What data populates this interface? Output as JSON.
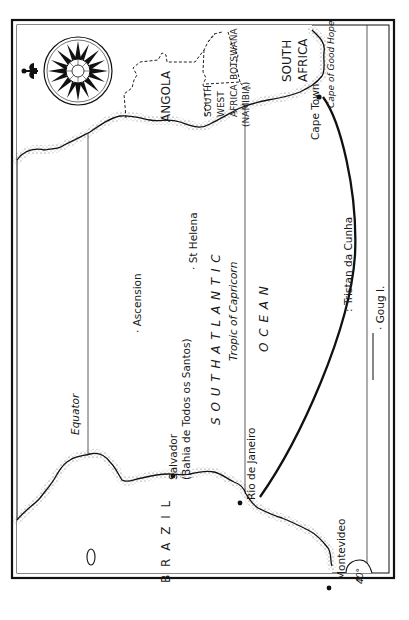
{
  "map": {
    "orientation": "rotated 90 degrees counter-clockwise (north to the left)",
    "reference_lines": [
      {
        "label": "Equator"
      },
      {
        "label": "Tropic of Capricorn"
      },
      {
        "label": "40°"
      }
    ],
    "countries": {
      "angola": "ANGOLA",
      "botswana": "BOTSWANA",
      "south_west_africa_1": "SOUTH",
      "south_west_africa_2": "WEST",
      "south_west_africa_3": "AFRICA",
      "namibia": "(NAMIBIA)",
      "south_africa_1": "SOUTH",
      "south_africa_2": "AFRICA",
      "brazil": "B R A Z I L"
    },
    "ocean": {
      "line1": "S O U T H   A T L A N T I C",
      "line2": "O C E A N"
    },
    "places": {
      "cape_town": "Cape Town",
      "cape_of_good_hope": "Cape of Good Hope",
      "tristan": ": Tristan da Cunha",
      "gough": "· Goug I.",
      "st_helena": "· St Helena",
      "ascension": "· Ascension",
      "salvador": "Salvador",
      "salvador_alt": "(Bahia de Todos os Santos)",
      "rio": "Rio de Janeiro",
      "montevideo": "Montevideo"
    },
    "route": {
      "from": "Rio de Janeiro",
      "to": "Cape Town"
    },
    "compass": {
      "type": "compass-rose",
      "north_marker": "fleur-de-lis"
    },
    "colors": {
      "ink": "#111111",
      "paper": "#ffffff",
      "stipple": "#555555"
    }
  }
}
